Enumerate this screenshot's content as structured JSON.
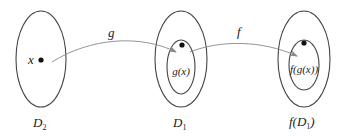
{
  "diagram": {
    "sets": [
      {
        "id": "D2",
        "label": "D₂",
        "label_base": "D",
        "label_sub": "2",
        "element_label": "x"
      },
      {
        "id": "D1",
        "label": "D₁",
        "label_base": "D",
        "label_sub": "1",
        "element_label": "g(x)"
      },
      {
        "id": "fD1",
        "label": "f(D₁)",
        "label_prefix": "f(D",
        "label_sub": "1",
        "label_suffix": ")",
        "element_label": "f(g(x))"
      }
    ],
    "arrows": [
      {
        "id": "g",
        "label": "g",
        "from": "D2",
        "to": "D1"
      },
      {
        "id": "f",
        "label": "f",
        "from": "D1",
        "to": "fD1"
      }
    ],
    "colors": {
      "outline": "#444444",
      "arrow": "#888888",
      "dot": "#111111",
      "text": "#222222",
      "background": "#ffffff"
    }
  }
}
